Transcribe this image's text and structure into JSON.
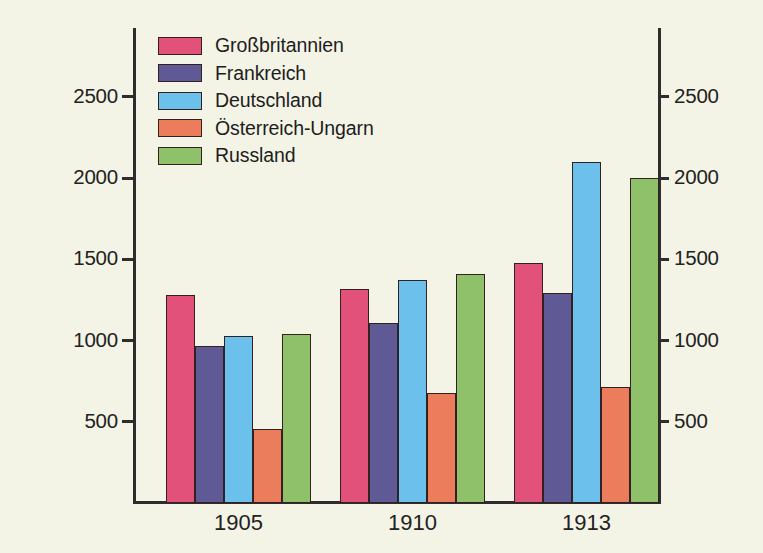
{
  "chart_data": {
    "type": "bar",
    "title": "",
    "subtitle": "",
    "xlabel": "",
    "ylabel": "",
    "categories": [
      "1905",
      "1910",
      "1913"
    ],
    "series": [
      {
        "name": "Großbritannien",
        "color": "#e1517a",
        "values": [
          1280,
          1320,
          1480
        ]
      },
      {
        "name": "Frankreich",
        "color": "#5f5a96",
        "values": [
          965,
          1110,
          1290
        ]
      },
      {
        "name": "Deutschland",
        "color": "#6cc0ec",
        "values": [
          1030,
          1370,
          2100
        ]
      },
      {
        "name": "Österreich-Ungarn",
        "color": "#ec7d5c",
        "values": [
          455,
          680,
          715
        ]
      },
      {
        "name": "Russland",
        "color": "#8fc06a",
        "values": [
          1040,
          1410,
          2000
        ]
      }
    ],
    "ylim": [
      0,
      2920
    ],
    "yticks": [
      500,
      1000,
      1500,
      2000,
      2500
    ],
    "ytick_labels_left": [
      "500",
      "1000",
      "1500",
      "2000",
      "2500"
    ],
    "ytick_labels_right": [
      "500",
      "1000",
      "1500",
      "2000",
      "2500"
    ],
    "grid": false,
    "legend_position": "top-left",
    "dual_axis": true,
    "background_color": "#f4f4e6",
    "axis_color": "#2d2d2d",
    "bar_edge_color": "#332020"
  },
  "legend": {
    "entries": [
      {
        "label": "Großbritannien"
      },
      {
        "label": "Frankreich"
      },
      {
        "label": "Deutschland"
      },
      {
        "label": "Österreich-Ungarn"
      },
      {
        "label": "Russland"
      }
    ]
  }
}
